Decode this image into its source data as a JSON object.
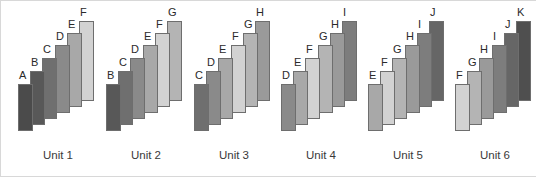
{
  "figure": {
    "background_color": "#ffffff",
    "bar_outline_color": "#6e6e6e",
    "label_color": "#2a2a2a",
    "caption_color": "#3a3a3a"
  },
  "shade_legend": {
    "A": "#4b4b4b",
    "B": "#585858",
    "C": "#6f6f6f",
    "D": "#8a8a8a",
    "E": "#a8a8a8",
    "F": "#d2d2d2",
    "G": "#b4b4b4",
    "H": "#9a9a9a",
    "I": "#7d7d7d",
    "J": "#666666",
    "K": "#4f4f4f"
  },
  "chart_data": {
    "type": "bar",
    "xlabel": "",
    "ylabel": "",
    "grid": false,
    "legend_position": "none",
    "note": "Six unit groups; each group holds six stepped bars. Bar tops and bottoms both rise left-to-right, forming a diagonal staircase. Bar grey shade is tied to the bar letter, not its position.",
    "categories": [
      "Unit 1",
      "Unit 2",
      "Unit 3",
      "Unit 4",
      "Unit 5",
      "Unit 6"
    ],
    "groups": [
      {
        "label": "Unit 1",
        "bars": [
          {
            "label": "A",
            "top": 84,
            "bottom": 131,
            "height": 47,
            "shade": "#4b4b4b"
          },
          {
            "label": "B",
            "top": 71,
            "bottom": 125,
            "height": 54,
            "shade": "#585858"
          },
          {
            "label": "C",
            "top": 58,
            "bottom": 119,
            "height": 61,
            "shade": "#6f6f6f"
          },
          {
            "label": "D",
            "top": 45,
            "bottom": 113,
            "height": 68,
            "shade": "#8a8a8a"
          },
          {
            "label": "E",
            "top": 33,
            "bottom": 107,
            "height": 74,
            "shade": "#a8a8a8"
          },
          {
            "label": "F",
            "top": 21,
            "bottom": 101,
            "height": 80,
            "shade": "#d2d2d2"
          }
        ]
      },
      {
        "label": "Unit 2",
        "bars": [
          {
            "label": "B",
            "top": 84,
            "bottom": 131,
            "height": 47,
            "shade": "#585858"
          },
          {
            "label": "C",
            "top": 71,
            "bottom": 125,
            "height": 54,
            "shade": "#6f6f6f"
          },
          {
            "label": "D",
            "top": 58,
            "bottom": 119,
            "height": 61,
            "shade": "#8a8a8a"
          },
          {
            "label": "E",
            "top": 45,
            "bottom": 113,
            "height": 68,
            "shade": "#a8a8a8"
          },
          {
            "label": "F",
            "top": 33,
            "bottom": 107,
            "height": 74,
            "shade": "#d2d2d2"
          },
          {
            "label": "G",
            "top": 21,
            "bottom": 101,
            "height": 80,
            "shade": "#b4b4b4"
          }
        ]
      },
      {
        "label": "Unit 3",
        "bars": [
          {
            "label": "C",
            "top": 84,
            "bottom": 131,
            "height": 47,
            "shade": "#6f6f6f"
          },
          {
            "label": "D",
            "top": 71,
            "bottom": 125,
            "height": 54,
            "shade": "#8a8a8a"
          },
          {
            "label": "E",
            "top": 58,
            "bottom": 119,
            "height": 61,
            "shade": "#a8a8a8"
          },
          {
            "label": "F",
            "top": 45,
            "bottom": 113,
            "height": 68,
            "shade": "#d2d2d2"
          },
          {
            "label": "G",
            "top": 33,
            "bottom": 107,
            "height": 74,
            "shade": "#b4b4b4"
          },
          {
            "label": "H",
            "top": 21,
            "bottom": 101,
            "height": 80,
            "shade": "#9a9a9a"
          }
        ]
      },
      {
        "label": "Unit 4",
        "bars": [
          {
            "label": "D",
            "top": 84,
            "bottom": 131,
            "height": 47,
            "shade": "#8a8a8a"
          },
          {
            "label": "E",
            "top": 71,
            "bottom": 125,
            "height": 54,
            "shade": "#a8a8a8"
          },
          {
            "label": "F",
            "top": 58,
            "bottom": 119,
            "height": 61,
            "shade": "#d2d2d2"
          },
          {
            "label": "G",
            "top": 45,
            "bottom": 113,
            "height": 68,
            "shade": "#b4b4b4"
          },
          {
            "label": "H",
            "top": 33,
            "bottom": 107,
            "height": 74,
            "shade": "#9a9a9a"
          },
          {
            "label": "I",
            "top": 21,
            "bottom": 101,
            "height": 80,
            "shade": "#7d7d7d"
          }
        ]
      },
      {
        "label": "Unit 5",
        "bars": [
          {
            "label": "E",
            "top": 84,
            "bottom": 131,
            "height": 47,
            "shade": "#a8a8a8"
          },
          {
            "label": "F",
            "top": 71,
            "bottom": 125,
            "height": 54,
            "shade": "#d2d2d2"
          },
          {
            "label": "G",
            "top": 58,
            "bottom": 119,
            "height": 61,
            "shade": "#b4b4b4"
          },
          {
            "label": "H",
            "top": 45,
            "bottom": 113,
            "height": 68,
            "shade": "#9a9a9a"
          },
          {
            "label": "I",
            "top": 33,
            "bottom": 107,
            "height": 74,
            "shade": "#7d7d7d"
          },
          {
            "label": "J",
            "top": 21,
            "bottom": 101,
            "height": 80,
            "shade": "#666666"
          }
        ]
      },
      {
        "label": "Unit 6",
        "bars": [
          {
            "label": "F",
            "top": 84,
            "bottom": 131,
            "height": 47,
            "shade": "#d2d2d2"
          },
          {
            "label": "G",
            "top": 71,
            "bottom": 125,
            "height": 54,
            "shade": "#b4b4b4"
          },
          {
            "label": "H",
            "top": 58,
            "bottom": 119,
            "height": 61,
            "shade": "#9a9a9a"
          },
          {
            "label": "I",
            "top": 45,
            "bottom": 113,
            "height": 68,
            "shade": "#7d7d7d"
          },
          {
            "label": "J",
            "top": 33,
            "bottom": 107,
            "height": 74,
            "shade": "#666666"
          },
          {
            "label": "K",
            "top": 21,
            "bottom": 101,
            "height": 80,
            "shade": "#4f4f4f"
          }
        ]
      }
    ]
  },
  "layout": {
    "unit_origins_x": [
      18,
      106,
      194,
      281,
      368,
      455
    ],
    "unit_width": 80,
    "bar_width": 15,
    "bar_pitch": 12.2
  }
}
